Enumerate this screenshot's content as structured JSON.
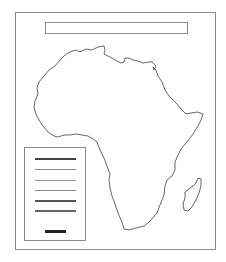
{
  "map": {
    "title": "",
    "region": "Africa",
    "features": [
      "continent-outline-africa",
      "island-madagascar"
    ],
    "outline_color": "#555555",
    "frame_color": "#8a8a8a"
  },
  "legend": {
    "items": [
      {
        "label": "",
        "color": "#444444",
        "weight": 2
      },
      {
        "label": "",
        "color": "#888888",
        "weight": 1
      },
      {
        "label": "",
        "color": "#999999",
        "weight": 1
      },
      {
        "label": "",
        "color": "#888888",
        "weight": 1
      },
      {
        "label": "",
        "color": "#555555",
        "weight": 2
      },
      {
        "label": "",
        "color": "#666666",
        "weight": 2
      }
    ],
    "scale_bar": {
      "label": "",
      "color": "#222222"
    }
  }
}
